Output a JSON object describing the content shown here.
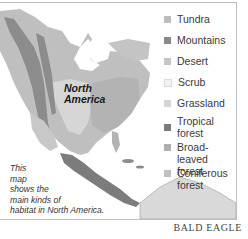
{
  "map": {
    "region_label_line1": "North",
    "region_label_line2": "America",
    "caption_lines": [
      "This",
      "map",
      "shows the",
      "main kinds of",
      "habitat in North America."
    ]
  },
  "legend": {
    "items": [
      {
        "label": "Tundra",
        "color": "#bdbdbd"
      },
      {
        "label": "Mountains",
        "color": "#8a8a8a"
      },
      {
        "label": "Desert",
        "color": "#c6c6c6"
      },
      {
        "label": "Scrub",
        "color": "#f2f2f2"
      },
      {
        "label": "Grassland",
        "color": "#d4d4d4"
      },
      {
        "label": "Tropical forest",
        "line1": "Tropical",
        "line2": "forest",
        "color": "#7a7a7a"
      },
      {
        "label": "Broad-leaved forest",
        "line1": "Broad-leaved",
        "line2": "forest",
        "color": "#b0b0b0"
      },
      {
        "label": "Coniferous forest",
        "line1": "Coniferous",
        "line2": "forest",
        "color": "#c0c0c0"
      }
    ]
  },
  "credit": "BALD EAGLE"
}
